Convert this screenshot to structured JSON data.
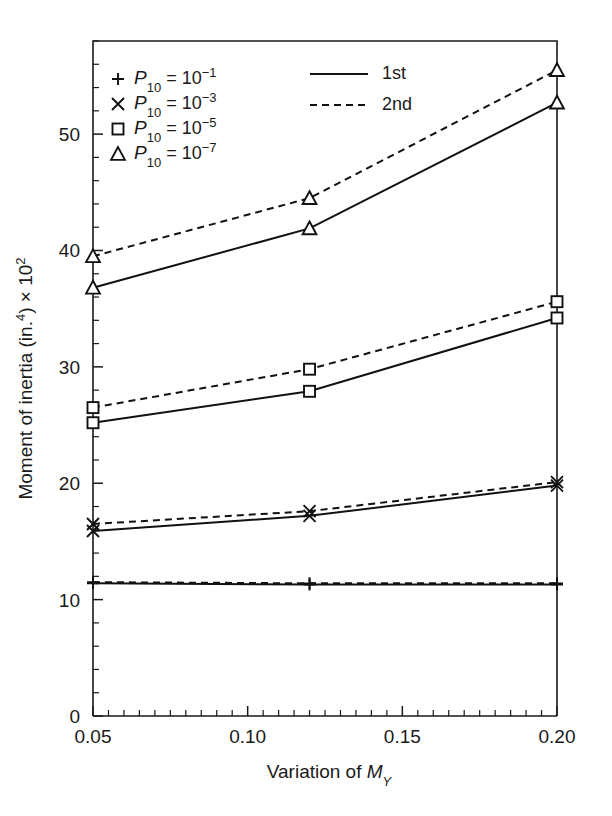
{
  "chart_data": {
    "type": "line",
    "title": "",
    "xlabel": "Variation of M_Y",
    "xlabel_parts": {
      "text": "Variation of ",
      "symbol": "M",
      "sub": "Y"
    },
    "ylabel": "Moment of inertia (in.^4) x 10^2",
    "ylabel_parts": {
      "text": "Moment of inertia (in.",
      "sup1": "4",
      "mid": ") × 10",
      "sup2": "2"
    },
    "x": [
      0.05,
      0.12,
      0.2
    ],
    "xlim": [
      0.05,
      0.2
    ],
    "ylim": [
      0,
      58
    ],
    "xticks": [
      0.05,
      0.1,
      0.15,
      0.2
    ],
    "xtick_labels": [
      "0.05",
      "0.10",
      "0.15",
      "0.20"
    ],
    "yticks": [
      0,
      10,
      20,
      30,
      40,
      50
    ],
    "ytick_labels": [
      "0",
      "10",
      "20",
      "30",
      "40",
      "50"
    ],
    "x_minor_step": 0.005,
    "y_minor_step": 2,
    "grid": false,
    "legend_position": "top-left-inside",
    "series": [
      {
        "name": "P10 = 10^-1, 1st",
        "marker": "plus",
        "style": "solid",
        "values": [
          11.4,
          11.3,
          11.3
        ]
      },
      {
        "name": "P10 = 10^-1, 2nd",
        "marker": "plus",
        "style": "dashed",
        "values": [
          11.5,
          11.4,
          11.4
        ]
      },
      {
        "name": "P10 = 10^-3, 1st",
        "marker": "cross",
        "style": "solid",
        "values": [
          15.9,
          17.2,
          19.8
        ]
      },
      {
        "name": "P10 = 10^-3, 2nd",
        "marker": "cross",
        "style": "dashed",
        "values": [
          16.5,
          17.6,
          20.1
        ]
      },
      {
        "name": "P10 = 10^-5, 1st",
        "marker": "square",
        "style": "solid",
        "values": [
          25.2,
          27.9,
          34.2
        ]
      },
      {
        "name": "P10 = 10^-5, 2nd",
        "marker": "square",
        "style": "dashed",
        "values": [
          26.5,
          29.8,
          35.6
        ]
      },
      {
        "name": "P10 = 10^-7, 1st",
        "marker": "triangle",
        "style": "solid",
        "values": [
          36.8,
          41.9,
          52.7
        ]
      },
      {
        "name": "P10 = 10^-7, 2nd",
        "marker": "triangle",
        "style": "dashed",
        "values": [
          39.5,
          44.5,
          55.5
        ]
      }
    ],
    "legend_markers": [
      {
        "marker": "plus",
        "symbol": "P",
        "sub": "10",
        "eq": " = 10",
        "sup": "−1"
      },
      {
        "marker": "cross",
        "symbol": "P",
        "sub": "10",
        "eq": " = 10",
        "sup": "−3"
      },
      {
        "marker": "square",
        "symbol": "P",
        "sub": "10",
        "eq": " = 10",
        "sup": "−5"
      },
      {
        "marker": "triangle",
        "symbol": "P",
        "sub": "10",
        "eq": " = 10",
        "sup": "−7"
      }
    ],
    "legend_styles": [
      {
        "style": "solid",
        "label": "1st"
      },
      {
        "style": "dashed",
        "label": "2nd"
      }
    ],
    "colors": {
      "ink": "#111111",
      "background": "#ffffff"
    }
  }
}
